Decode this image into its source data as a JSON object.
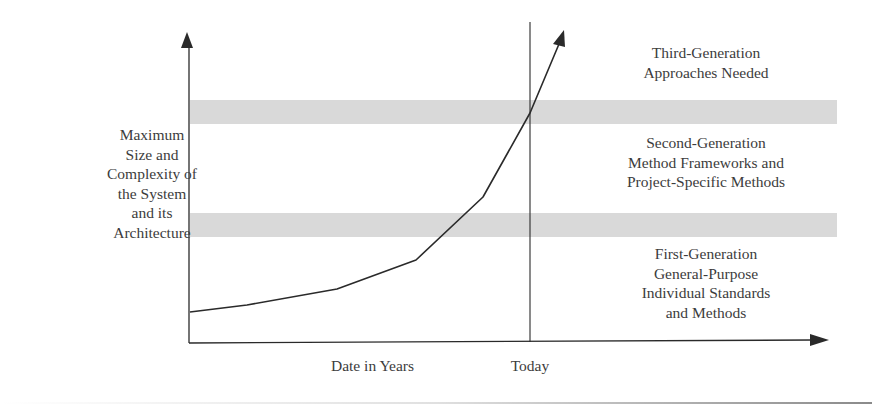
{
  "diagram": {
    "type": "growth-curve-with-zones",
    "y_axis_label": [
      "Maximum",
      "Size and",
      "Complexity of",
      "the System",
      "and its",
      "Architecture"
    ],
    "x_axis_label": "Date in Years",
    "today_marker_label": "Today",
    "zones": [
      {
        "id": "third",
        "lines": [
          "Third-Generation",
          "Approaches Needed"
        ]
      },
      {
        "id": "second",
        "lines": [
          "Second-Generation",
          "Method Frameworks and",
          "Project-Specific Methods"
        ]
      },
      {
        "id": "first",
        "lines": [
          "First-Generation",
          "General-Purpose",
          "Individual Standards",
          "and Methods"
        ]
      }
    ],
    "boundary_bands": [
      {
        "y_top": 100,
        "y_bottom": 124,
        "color": "#d9d9d9"
      },
      {
        "y_top": 213,
        "y_bottom": 237,
        "color": "#d9d9d9"
      }
    ],
    "curve_points": [
      [
        190,
        312
      ],
      [
        247,
        305
      ],
      [
        337,
        289
      ],
      [
        416,
        260
      ],
      [
        483,
        197
      ],
      [
        530,
        113
      ],
      [
        561,
        38
      ]
    ],
    "colors": {
      "axis": "#2a2a2a",
      "curve": "#2a2a2a",
      "band": "#d9d9d9",
      "text": "#3c3c3c"
    }
  }
}
